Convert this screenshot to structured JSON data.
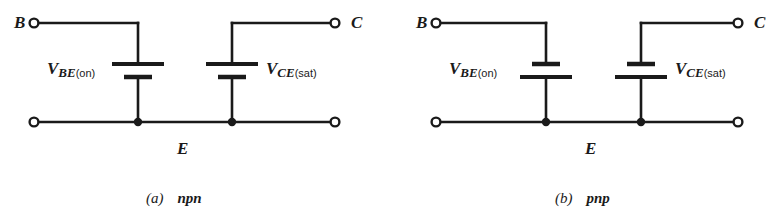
{
  "figure": {
    "kind": "circuit-diagram",
    "ink_color": "#1a1a1a",
    "background_color": "#ffffff"
  },
  "panels": [
    {
      "id": "a",
      "caption_part": "(a)",
      "caption_kind": "npn",
      "terminals": {
        "base": "B",
        "collector": "C",
        "emitter": "E"
      },
      "sources": [
        {
          "id": "vbe",
          "main": "V",
          "sub_italic": "BE",
          "sub_upright": "(on)",
          "label_side": "left",
          "polarity": "plus-top"
        },
        {
          "id": "vce",
          "main": "V",
          "sub_italic": "CE",
          "sub_upright": "(sat)",
          "label_side": "right",
          "polarity": "plus-top"
        }
      ]
    },
    {
      "id": "b",
      "caption_part": "(b)",
      "caption_kind": "pnp",
      "terminals": {
        "base": "B",
        "collector": "C",
        "emitter": "E"
      },
      "sources": [
        {
          "id": "vbe",
          "main": "V",
          "sub_italic": "BE",
          "sub_upright": "(on)",
          "label_side": "left",
          "polarity": "minus-top"
        },
        {
          "id": "vce",
          "main": "V",
          "sub_italic": "CE",
          "sub_upright": "(sat)",
          "label_side": "right",
          "polarity": "minus-top"
        }
      ]
    }
  ]
}
